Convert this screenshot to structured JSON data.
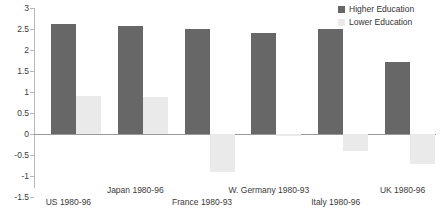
{
  "legend": {
    "position": "top-right",
    "items": [
      {
        "label": "Higher Education",
        "color": "#676767",
        "key": "higher"
      },
      {
        "label": "Lower Education",
        "color": "#eaeaea",
        "key": "lower"
      }
    ]
  },
  "axis": {
    "ticks": [
      "3",
      "2.5",
      "2",
      "1.5",
      "1",
      "0.5",
      "0",
      "-0.5",
      "-1",
      "-1.5"
    ],
    "tick_values": [
      3,
      2.5,
      2,
      1.5,
      1,
      0.5,
      0,
      -0.5,
      -1,
      -1.5
    ]
  },
  "chart_data": {
    "type": "bar",
    "title": "",
    "xlabel": "",
    "ylabel": "",
    "ylim": [
      -1.5,
      3
    ],
    "ytick_step": 0.5,
    "grid": false,
    "legend_position": "top-right",
    "categories": [
      "US  1980-96",
      "Japan  1980-96",
      "France  1980-93",
      "W. Germany 1980-93",
      "Italy 1980-96",
      "UK  1980-96"
    ],
    "series": [
      {
        "name": "Higher Education",
        "color": "#676767",
        "values": [
          2.62,
          2.58,
          2.5,
          2.4,
          2.5,
          1.72
        ]
      },
      {
        "name": "Lower Education",
        "color": "#eaeaea",
        "values": [
          0.9,
          0.88,
          -0.9,
          -0.05,
          -0.4,
          -0.72
        ]
      }
    ]
  }
}
